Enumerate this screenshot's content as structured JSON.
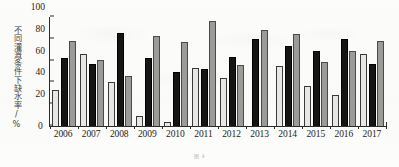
{
  "chart_data": {
    "type": "bar",
    "title": "",
    "xlabel": "",
    "ylabel": "不同灌溉条件下缺水率/%",
    "ylim": [
      0,
      100
    ],
    "yticks": [
      0,
      20,
      40,
      60,
      80,
      100
    ],
    "grid": false,
    "legend": "none",
    "categories": [
      "2006",
      "2007",
      "2008",
      "2009",
      "2010",
      "2011",
      "2012",
      "2013",
      "2014",
      "2015",
      "2016",
      "2017"
    ],
    "series": [
      {
        "name": "series-1",
        "color": "#e7e7e4",
        "values": [
          33,
          66,
          40,
          9,
          4,
          53,
          44,
          0,
          55,
          37,
          28,
          66
        ]
      },
      {
        "name": "series-2",
        "color": "#151515",
        "values": [
          62,
          57,
          85,
          62,
          50,
          52,
          63,
          80,
          73,
          69,
          80,
          57
        ]
      },
      {
        "name": "series-3",
        "color": "#9b9b98",
        "values": [
          78,
          61,
          46,
          83,
          77,
          96,
          56,
          88,
          84,
          59,
          69,
          78
        ]
      }
    ]
  },
  "caption": {
    "text": "图 4"
  }
}
